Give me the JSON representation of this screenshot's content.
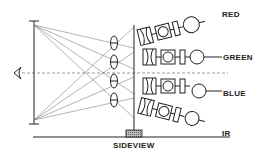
{
  "diagram": {
    "type": "optical-sideview",
    "caption": "SIDEVIEW",
    "channels": [
      {
        "label": "RED"
      },
      {
        "label": "GREEN"
      },
      {
        "label": "BLUE"
      },
      {
        "label": "IR"
      }
    ],
    "colors": {
      "ink": "#222222",
      "ray": "#555555",
      "hatch": "#888888",
      "background": "#ffffff"
    }
  }
}
